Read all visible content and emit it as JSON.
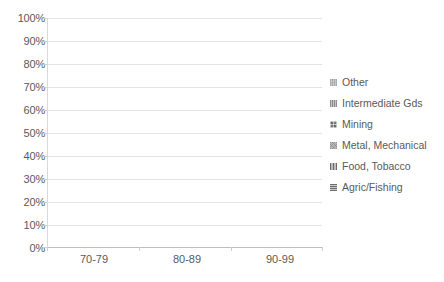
{
  "chart_data": {
    "type": "bar",
    "subtype": "100% stacked column",
    "title": "",
    "xlabel": "",
    "ylabel": "",
    "ylim": [
      0,
      100
    ],
    "ytick_labels": [
      "100%",
      "90%",
      "80%",
      "70%",
      "60%",
      "50%",
      "40%",
      "30%",
      "20%",
      "10%",
      "0%"
    ],
    "ytick_values": [
      100,
      90,
      80,
      70,
      60,
      50,
      40,
      30,
      20,
      10,
      0
    ],
    "grid": true,
    "legend_position": "right",
    "categories": [
      "70-79",
      "80-89",
      "90-99"
    ],
    "series": [
      {
        "name": "Agric/Fishing",
        "values": [
          0.5,
          1.0,
          1.5
        ]
      },
      {
        "name": "Food, Tobacco",
        "values": [
          0.5,
          0.8,
          1.2
        ]
      },
      {
        "name": "Metal, Mechanical",
        "values": [
          0.5,
          0.7,
          2.3
        ]
      },
      {
        "name": "Mining",
        "values": [
          66.5,
          57.5,
          52.0
        ]
      },
      {
        "name": "Intermediate Gds",
        "values": [
          0.5,
          0.5,
          0.5
        ]
      },
      {
        "name": "Other",
        "values": [
          31.5,
          39.5,
          42.5
        ]
      }
    ]
  },
  "legend": {
    "items": [
      {
        "label": "Other",
        "swatch": "pattern-swatch-other"
      },
      {
        "label": "Intermediate Gds",
        "swatch": "pattern-swatch-intermediate"
      },
      {
        "label": "Mining",
        "swatch": "pattern-swatch-mining"
      },
      {
        "label": "Metal, Mechanical",
        "swatch": "pattern-swatch-metal"
      },
      {
        "label": "Food, Tobacco",
        "swatch": "pattern-swatch-food"
      },
      {
        "label": "Agric/Fishing",
        "swatch": "pattern-swatch-agric"
      }
    ]
  },
  "colors": {
    "other": "#c9c9c9",
    "intermediate": "#a8a8a8",
    "mining": "#7a7a7a",
    "metal": "#b5b5b5",
    "food": "#8a8a8a",
    "agric": "#9e9e9e",
    "gridline": "#e4e4e4",
    "axis": "#bfbfbf",
    "text": "#5a5a5a",
    "background": "#ffffff"
  }
}
